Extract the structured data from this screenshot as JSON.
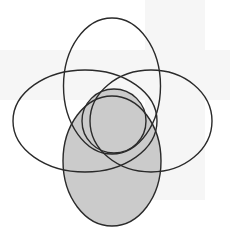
{
  "diagram": {
    "type": "venn-four-sets",
    "colors": {
      "background": "#ffffff",
      "stroke": "#2a2a2a",
      "shaded_fill": "#cbcbcb",
      "unshaded_fill": "none"
    },
    "shapes": [
      {
        "id": "top-ellipse",
        "cx": 112,
        "cy": 86,
        "rx": 48.5,
        "ry": 68,
        "shaded": false
      },
      {
        "id": "left-ellipse",
        "cx": 85,
        "cy": 121,
        "rx": 72,
        "ry": 51,
        "shaded": false
      },
      {
        "id": "right-ellipse",
        "cx": 151,
        "cy": 121,
        "rx": 61,
        "ry": 51,
        "shaded": false
      },
      {
        "id": "bottom-ellipse",
        "cx": 112,
        "cy": 161,
        "rx": 49,
        "ry": 65,
        "shaded": true
      },
      {
        "id": "center-circle",
        "cx": 114,
        "cy": 121,
        "rx": 32,
        "ry": 32,
        "shaded": true
      }
    ]
  }
}
